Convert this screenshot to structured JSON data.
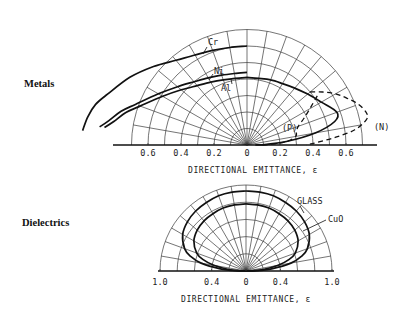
{
  "chart_data": [
    {
      "type": "polar",
      "panel_label": "Metals",
      "xlabel": "DIRECTIONAL EMITTANCE, ε",
      "radial_range": [
        0,
        0.7
      ],
      "radial_step": 0.1,
      "angle_step_deg": 10,
      "tick_labels": [
        {
          "value": -0.6,
          "label": "0.6"
        },
        {
          "value": -0.4,
          "label": "0.4"
        },
        {
          "value": -0.2,
          "label": "0.2"
        },
        {
          "value": 0,
          "label": "0"
        },
        {
          "value": 0.2,
          "label": "0.2"
        },
        {
          "value": 0.4,
          "label": "0.4"
        },
        {
          "value": 0.6,
          "label": "0.6"
        }
      ],
      "series": [
        {
          "name": "Cr",
          "style": "solid",
          "side": "left",
          "theta_deg": [
            0,
            10,
            20,
            30,
            40,
            50,
            60,
            70,
            75,
            80,
            85
          ],
          "emittance": [
            0.6,
            0.6,
            0.61,
            0.63,
            0.67,
            0.74,
            0.82,
            0.9,
            0.95,
            0.98,
            1.0
          ]
        },
        {
          "name": "Ni",
          "style": "solid",
          "side": "left",
          "theta_deg": [
            0,
            10,
            20,
            30,
            40,
            50,
            60,
            70,
            75,
            80,
            83
          ],
          "emittance": [
            0.44,
            0.44,
            0.45,
            0.47,
            0.5,
            0.55,
            0.62,
            0.72,
            0.79,
            0.85,
            0.9
          ]
        },
        {
          "name": "Al",
          "style": "solid",
          "side": "left",
          "theta_deg": [
            0,
            10,
            20,
            30,
            40,
            50,
            60,
            70,
            75,
            80,
            83
          ],
          "emittance": [
            0.41,
            0.41,
            0.42,
            0.44,
            0.47,
            0.52,
            0.59,
            0.69,
            0.76,
            0.82,
            0.87
          ]
        },
        {
          "name": "Al",
          "style": "solid",
          "side": "right",
          "theta_deg": [
            0,
            10,
            20,
            30,
            40,
            50,
            60,
            70,
            75,
            80,
            85,
            88,
            90
          ],
          "emittance": [
            0.41,
            0.41,
            0.42,
            0.43,
            0.45,
            0.48,
            0.52,
            0.58,
            0.55,
            0.42,
            0.24,
            0.12,
            0.05
          ]
        },
        {
          "name": "(P)",
          "style": "dashed",
          "side": "right",
          "theta_deg": [
            55,
            60,
            65,
            70,
            75,
            80,
            85,
            88,
            90
          ],
          "emittance": [
            0.52,
            0.44,
            0.38,
            0.33,
            0.31,
            0.3,
            0.24,
            0.15,
            0.08
          ]
        },
        {
          "name": "(N)",
          "style": "dashed",
          "side": "right",
          "theta_deg": [
            50,
            55,
            60,
            65,
            70,
            75,
            78,
            82,
            85,
            88,
            90
          ],
          "emittance": [
            0.5,
            0.56,
            0.62,
            0.67,
            0.72,
            0.75,
            0.74,
            0.66,
            0.54,
            0.42,
            0.36
          ]
        }
      ],
      "annotations": [
        "Cr",
        "Ni",
        "Al",
        "(P)",
        "(N)"
      ]
    },
    {
      "type": "polar",
      "panel_label": "Dielectrics",
      "xlabel": "DIRECTIONAL EMITTANCE, ε",
      "radial_range": [
        0,
        1.0
      ],
      "radial_step": 0.2,
      "angle_step_deg": 10,
      "tick_labels": [
        {
          "value": -1.0,
          "label": "1.0"
        },
        {
          "value": -0.4,
          "label": "0.4"
        },
        {
          "value": 0,
          "label": "0"
        },
        {
          "value": 0.4,
          "label": "0.4"
        },
        {
          "value": 1.0,
          "label": "1.0"
        }
      ],
      "series": [
        {
          "name": "GLASS",
          "style": "solid",
          "side": "both",
          "theta_deg": [
            0,
            10,
            20,
            30,
            40,
            50,
            60,
            70,
            75,
            80,
            85,
            88,
            90
          ],
          "emittance": [
            0.93,
            0.93,
            0.93,
            0.92,
            0.91,
            0.89,
            0.85,
            0.76,
            0.67,
            0.53,
            0.3,
            0.12,
            0.0
          ]
        },
        {
          "name": "CuO",
          "style": "solid",
          "side": "both",
          "theta_deg": [
            0,
            10,
            20,
            30,
            40,
            50,
            60,
            70,
            75,
            80,
            85,
            88,
            90
          ],
          "emittance": [
            0.78,
            0.78,
            0.78,
            0.77,
            0.76,
            0.74,
            0.7,
            0.61,
            0.52,
            0.38,
            0.2,
            0.08,
            0.0
          ]
        }
      ],
      "annotations": [
        "GLASS",
        "CuO"
      ]
    }
  ]
}
